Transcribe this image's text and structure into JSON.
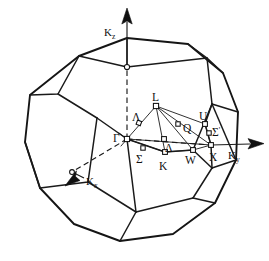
{
  "figure": {
    "shape": "truncated-octahedron",
    "line_color": "#151515",
    "background": "#ffffff"
  },
  "axes": [
    {
      "id": "kz",
      "label": "K",
      "subscript": "z",
      "direction": "up",
      "label_x": 104,
      "label_y": 33
    },
    {
      "id": "ky",
      "label": "K",
      "subscript": "y",
      "direction": "right",
      "label_x": 231,
      "label_y": 155
    },
    {
      "id": "kx",
      "label": "K",
      "subscript": "x",
      "direction": "lower-left",
      "label_x": 88,
      "label_y": 182
    }
  ],
  "points": [
    {
      "id": "gamma",
      "label": "Γ",
      "x": 127,
      "y": 139,
      "label_x": 115,
      "label_y": 138
    },
    {
      "id": "l",
      "label": "L",
      "x": 156,
      "y": 106,
      "label_x": 153,
      "label_y": 100
    },
    {
      "id": "u",
      "label": "U",
      "x": 205,
      "y": 124,
      "label_x": 201,
      "label_y": 119
    },
    {
      "id": "x",
      "label": "X",
      "x": 211,
      "y": 145,
      "label_x": 215,
      "label_y": 158
    },
    {
      "id": "w",
      "label": "W",
      "x": 193,
      "y": 150,
      "label_x": 189,
      "label_y": 163
    },
    {
      "id": "k",
      "label": "K",
      "x": 165,
      "y": 152,
      "label_x": 161,
      "label_y": 166
    },
    {
      "id": "q",
      "label": "Q",
      "x": 178,
      "y": 124,
      "label_x": 183,
      "label_y": 130
    },
    {
      "id": "lambda",
      "label": "Λ",
      "x": 139,
      "y": 123,
      "label_x": 134,
      "label_y": 119
    },
    {
      "id": "delta",
      "label": "Δ",
      "x": 164,
      "y": 139,
      "label_x": 167,
      "label_y": 150
    },
    {
      "id": "sigma",
      "label": "Σ",
      "x": 143,
      "y": 148,
      "label_x": 138,
      "label_y": 160
    },
    {
      "id": "sigma-prime",
      "label": "Σ",
      "prime": "'",
      "x": 209,
      "y": 133,
      "label_x": 213,
      "label_y": 133
    }
  ],
  "legend": {
    "high_symmetry_points": [
      "Γ",
      "L",
      "X",
      "W",
      "K",
      "U"
    ],
    "symmetry_lines": [
      "Λ",
      "Δ",
      "Σ",
      "Σ'",
      "Q"
    ]
  }
}
